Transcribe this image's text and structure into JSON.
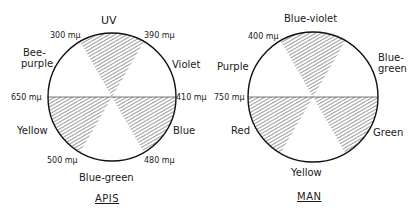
{
  "diagrams": [
    {
      "title": "APIS",
      "sectors": [
        {
          "label": "UV",
          "hatched": true
        },
        {
          "label": "Violet",
          "hatched": false
        },
        {
          "label": "Blue",
          "hatched": true
        },
        {
          "label": "Blue-green",
          "hatched": false
        },
        {
          "label": "Yellow",
          "hatched": true
        },
        {
          "label": "Bee-purple",
          "hatched": false
        }
      ],
      "wavelengths": {
        "top_left": "300 mμ",
        "top_right": "390 mμ",
        "right": "410 mμ",
        "bottom_right": "480 mμ",
        "bottom_left": "500 mμ",
        "left": "650 mμ"
      },
      "labels": {
        "top": "UV",
        "upper_right": "Violet",
        "lower_right": "Blue",
        "bottom": "Blue-green",
        "lower_left": "Yellow",
        "upper_left_1": "Bee-",
        "upper_left_2": "purple"
      }
    },
    {
      "title": "MAN",
      "sectors": [
        {
          "label": "Blue-violet",
          "hatched": true
        },
        {
          "label": "Blue-green",
          "hatched": false
        },
        {
          "label": "Green",
          "hatched": true
        },
        {
          "label": "Yellow",
          "hatched": false
        },
        {
          "label": "Red",
          "hatched": true
        },
        {
          "label": "Purple",
          "hatched": false
        }
      ],
      "wavelengths": {
        "top_left": "400 mμ",
        "left": "750 mμ"
      },
      "labels": {
        "top": "Blue-violet",
        "upper_right_1": "Blue-",
        "upper_right_2": "green",
        "lower_right": "Green",
        "bottom": "Yellow",
        "lower_left": "Red",
        "upper_left": "Purple"
      }
    }
  ]
}
